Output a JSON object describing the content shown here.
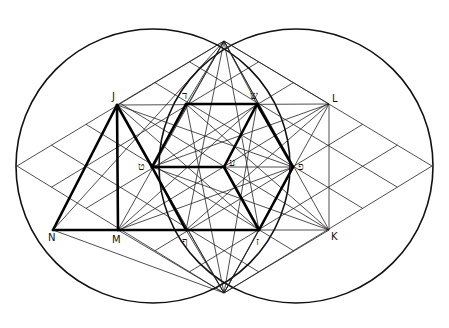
{
  "figure": {
    "type": "geometric-construction",
    "colors": {
      "stroke": "#000000",
      "background": "#ffffff"
    }
  },
  "circles": [
    {
      "name": "left-circle",
      "cx": 153,
      "cy": 166,
      "r": 136
    },
    {
      "name": "right-circle",
      "cx": 296,
      "cy": 166,
      "r": 136
    }
  ],
  "points": {
    "J": [
      117,
      105
    ],
    "dalet": [
      186,
      104
    ],
    "shin": [
      257,
      104
    ],
    "L": [
      329,
      104
    ],
    "tet": [
      152,
      167
    ],
    "ayin": [
      224,
      167
    ],
    "pe": [
      293,
      167
    ],
    "N": [
      53,
      230
    ],
    "M": [
      118,
      230
    ],
    "F": [
      186,
      230
    ],
    "zayin": [
      259,
      230
    ],
    "K": [
      329,
      230
    ],
    "top": [
      224,
      41
    ],
    "bottom": [
      224,
      293
    ],
    "left": [
      17,
      166
    ],
    "right": [
      432,
      166
    ]
  },
  "labels": [
    {
      "id": "J",
      "text": "J",
      "x": 112,
      "y": 100,
      "heb": false
    },
    {
      "id": "dalet",
      "text": "ד",
      "x": 182,
      "y": 99,
      "heb": true
    },
    {
      "id": "shin",
      "text": "ש",
      "x": 250,
      "y": 99,
      "heb": true
    },
    {
      "id": "L",
      "text": "L",
      "x": 332,
      "y": 102,
      "heb": false
    },
    {
      "id": "tet",
      "text": "ט",
      "x": 138,
      "y": 170,
      "heb": true
    },
    {
      "id": "ayin",
      "text": "ע",
      "x": 229,
      "y": 166,
      "heb": true
    },
    {
      "id": "pe",
      "text": "פ",
      "x": 298,
      "y": 170,
      "heb": true
    },
    {
      "id": "N",
      "text": "N",
      "x": 48,
      "y": 241,
      "heb": false
    },
    {
      "id": "M",
      "text": "M",
      "x": 112,
      "y": 243,
      "heb": false
    },
    {
      "id": "F",
      "text": "ף",
      "x": 182,
      "y": 245,
      "heb": true
    },
    {
      "id": "zayin",
      "text": "ז",
      "x": 256,
      "y": 245,
      "heb": true
    },
    {
      "id": "K",
      "text": "K",
      "x": 331,
      "y": 240,
      "heb": false
    }
  ]
}
